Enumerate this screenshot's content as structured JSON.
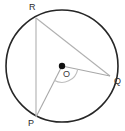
{
  "figure": {
    "type": "circle-geometry-diagram",
    "canvas": {
      "width": 125,
      "height": 131,
      "background": "#ffffff"
    },
    "colors": {
      "circle_stroke": "#262626",
      "chord_stroke": "#b0b0b0",
      "radius_stroke": "#a8a8a8",
      "angle_arc_stroke": "#bdbdbd",
      "center_dot_fill": "#111111",
      "label_text": "#2b2b2b"
    },
    "circle": {
      "center_x": 62,
      "center_y": 66,
      "radius": 56,
      "stroke_width": 1.6
    },
    "center_point": {
      "label": "O",
      "x": 62,
      "y": 66,
      "dot_radius": 3.2,
      "label_x": 63,
      "label_y": 70
    },
    "points": [
      {
        "label": "R",
        "x": 36,
        "y": 18,
        "label_x": 29,
        "label_y": 3
      },
      {
        "label": "Q",
        "x": 110,
        "y": 76,
        "label_x": 114,
        "label_y": 77
      },
      {
        "label": "P",
        "x": 36,
        "y": 117,
        "label_x": 28,
        "label_y": 119
      }
    ],
    "segments": [
      {
        "name": "chord-RQ",
        "from": "R",
        "to": "Q",
        "kind": "chord",
        "x1": 36,
        "y1": 18,
        "x2": 110,
        "y2": 76
      },
      {
        "name": "chord-RP",
        "from": "R",
        "to": "P",
        "kind": "chord",
        "x1": 36,
        "y1": 18,
        "x2": 36,
        "y2": 117
      },
      {
        "name": "radius-OQ",
        "from": "O",
        "to": "Q",
        "kind": "radius",
        "x1": 62,
        "y1": 66,
        "x2": 110,
        "y2": 76
      },
      {
        "name": "radius-OP",
        "from": "O",
        "to": "P",
        "kind": "radius",
        "x1": 62,
        "y1": 66,
        "x2": 36,
        "y2": 117
      }
    ],
    "angle_arc": {
      "name": "central-angle-POQ",
      "vertex": "O",
      "between": [
        "P",
        "Q"
      ],
      "radius": 16,
      "path": "M 54.0 80.2 A 16 16 0 0 0 77.7 69.3"
    }
  }
}
